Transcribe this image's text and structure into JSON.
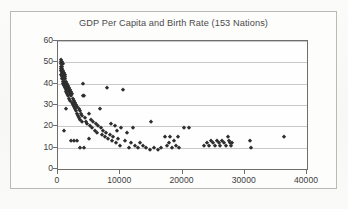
{
  "chart_data": {
    "type": "scatter",
    "title": "GDP Per Capita and Birth Rate (153 Nations)",
    "xlabel": "",
    "ylabel": "",
    "xlim": [
      0,
      40000
    ],
    "ylim": [
      0,
      60
    ],
    "xticks": [
      0,
      10000,
      20000,
      30000,
      40000
    ],
    "xtick_labels": [
      "0",
      "10000",
      "20000",
      "30000",
      "40000"
    ],
    "yticks": [
      0,
      10,
      20,
      30,
      40,
      50,
      60
    ],
    "ytick_labels": [
      "0",
      "10",
      "20",
      "30",
      "40",
      "50",
      "60"
    ],
    "grid": "horizontal",
    "legend": "none",
    "marker": "diamond",
    "marker_color": "#2e2e2e",
    "n_points": 153,
    "series": [
      {
        "name": "Nations",
        "points": [
          [
            420,
            48
          ],
          [
            450,
            50
          ],
          [
            470,
            46
          ],
          [
            500,
            51
          ],
          [
            520,
            44
          ],
          [
            540,
            49
          ],
          [
            560,
            47
          ],
          [
            580,
            43
          ],
          [
            600,
            50
          ],
          [
            620,
            45
          ],
          [
            640,
            48
          ],
          [
            660,
            42
          ],
          [
            680,
            46
          ],
          [
            700,
            44
          ],
          [
            720,
            47
          ],
          [
            740,
            41
          ],
          [
            760,
            45
          ],
          [
            780,
            43
          ],
          [
            800,
            49
          ],
          [
            820,
            40
          ],
          [
            850,
            44
          ],
          [
            880,
            46
          ],
          [
            900,
            42
          ],
          [
            930,
            45
          ],
          [
            960,
            39
          ],
          [
            990,
            43
          ],
          [
            1020,
            41
          ],
          [
            1050,
            44
          ],
          [
            1080,
            38
          ],
          [
            1110,
            42
          ],
          [
            1150,
            40
          ],
          [
            1190,
            43
          ],
          [
            1230,
            37
          ],
          [
            1270,
            41
          ],
          [
            1310,
            39
          ],
          [
            1350,
            36
          ],
          [
            1400,
            40
          ],
          [
            1450,
            38
          ],
          [
            1500,
            35
          ],
          [
            1550,
            39
          ],
          [
            1600,
            37
          ],
          [
            1650,
            34
          ],
          [
            1700,
            38
          ],
          [
            1760,
            36
          ],
          [
            1820,
            33
          ],
          [
            1880,
            37
          ],
          [
            1940,
            35
          ],
          [
            2000,
            32
          ],
          [
            2070,
            36
          ],
          [
            2140,
            34
          ],
          [
            2210,
            31
          ],
          [
            2280,
            35
          ],
          [
            2350,
            30
          ],
          [
            2420,
            33
          ],
          [
            2500,
            29
          ],
          [
            2580,
            32
          ],
          [
            2660,
            28
          ],
          [
            2740,
            31
          ],
          [
            2820,
            27
          ],
          [
            2900,
            30
          ],
          [
            3000,
            26
          ],
          [
            3100,
            29
          ],
          [
            3200,
            25
          ],
          [
            3300,
            28
          ],
          [
            3400,
            24
          ],
          [
            3500,
            27
          ],
          [
            3600,
            23
          ],
          [
            3700,
            26
          ],
          [
            3800,
            22
          ],
          [
            3900,
            25
          ],
          [
            4000,
            40
          ],
          [
            4050,
            34
          ],
          [
            4150,
            34
          ],
          [
            4300,
            24
          ],
          [
            4500,
            22
          ],
          [
            4700,
            21
          ],
          [
            4900,
            26
          ],
          [
            5100,
            20
          ],
          [
            5300,
            23
          ],
          [
            5500,
            19
          ],
          [
            5700,
            22
          ],
          [
            5900,
            18
          ],
          [
            6100,
            21
          ],
          [
            6300,
            17
          ],
          [
            6500,
            20
          ],
          [
            6700,
            28
          ],
          [
            6900,
            19
          ],
          [
            7100,
            16
          ],
          [
            7300,
            18
          ],
          [
            7500,
            15
          ],
          [
            7700,
            17
          ],
          [
            7900,
            38
          ],
          [
            8100,
            14
          ],
          [
            8300,
            16
          ],
          [
            8500,
            21
          ],
          [
            8700,
            13
          ],
          [
            8900,
            15
          ],
          [
            9100,
            20
          ],
          [
            9300,
            12
          ],
          [
            9500,
            18
          ],
          [
            9700,
            14
          ],
          [
            9900,
            11
          ],
          [
            10200,
            19
          ],
          [
            10500,
            37
          ],
          [
            10800,
            13
          ],
          [
            11100,
            17
          ],
          [
            11400,
            10
          ],
          [
            11700,
            12
          ],
          [
            12000,
            19
          ],
          [
            12400,
            11
          ],
          [
            12800,
            10
          ],
          [
            13200,
            12
          ],
          [
            13700,
            11
          ],
          [
            14200,
            10
          ],
          [
            14800,
            9
          ],
          [
            15000,
            22
          ],
          [
            15400,
            10
          ],
          [
            16000,
            9
          ],
          [
            16600,
            10
          ],
          [
            17200,
            15
          ],
          [
            17500,
            11
          ],
          [
            17800,
            12
          ],
          [
            18000,
            15
          ],
          [
            18300,
            10
          ],
          [
            18600,
            13
          ],
          [
            18900,
            11
          ],
          [
            19200,
            15
          ],
          [
            19500,
            10
          ],
          [
            20200,
            19
          ],
          [
            21000,
            19
          ],
          [
            23500,
            11
          ],
          [
            24000,
            12
          ],
          [
            24300,
            11
          ],
          [
            24600,
            13
          ],
          [
            24900,
            12
          ],
          [
            25200,
            11
          ],
          [
            25500,
            13
          ],
          [
            25800,
            12
          ],
          [
            26100,
            11
          ],
          [
            26400,
            13
          ],
          [
            26700,
            12
          ],
          [
            27000,
            11
          ],
          [
            27300,
            15
          ],
          [
            27400,
            13
          ],
          [
            27600,
            12
          ],
          [
            27800,
            11
          ],
          [
            28000,
            12
          ],
          [
            30800,
            13
          ],
          [
            31000,
            10
          ],
          [
            36300,
            15
          ],
          [
            1300,
            28
          ],
          [
            1000,
            18
          ],
          [
            2100,
            13
          ],
          [
            2600,
            13
          ],
          [
            3050,
            13
          ],
          [
            3500,
            10
          ],
          [
            4200,
            10
          ],
          [
            5000,
            14
          ]
        ]
      }
    ]
  }
}
